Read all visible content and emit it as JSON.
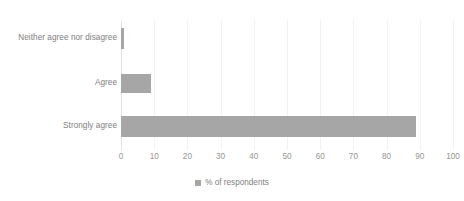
{
  "chart_data": {
    "type": "bar",
    "orientation": "horizontal",
    "title": "",
    "xlabel": "",
    "ylabel": "",
    "categories": [
      "Neither agree nor disagree",
      "Agree",
      "Strongly agree"
    ],
    "values": [
      1,
      9,
      89
    ],
    "series": [
      {
        "name": "% of respondents",
        "values": [
          1,
          9,
          89
        ],
        "color": "#a6a6a6"
      }
    ],
    "xlim": [
      0,
      100
    ],
    "xticks": [
      0,
      10,
      20,
      30,
      40,
      50,
      60,
      70,
      80,
      90,
      100
    ],
    "xtick_labels": [
      "0",
      "10",
      "20",
      "30",
      "40",
      "50",
      "60",
      "70",
      "80",
      "90",
      "100"
    ],
    "grid": "vertical",
    "legend": {
      "position": "bottom",
      "entries": [
        {
          "label": "% of respondents",
          "color": "#a6a6a6",
          "marker": "square-marker"
        }
      ]
    }
  },
  "colors": {
    "background": "#ffffff",
    "bar": "#a6a6a6",
    "gridline": "#f2f2f2",
    "axis_line": "#e4e4e4",
    "label_text": "#808080",
    "tick_text": "#959595"
  }
}
